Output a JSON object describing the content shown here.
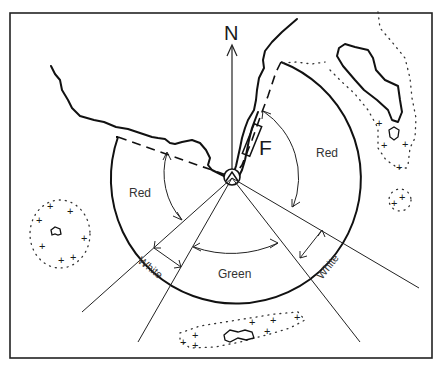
{
  "diagram": {
    "north_label": "N",
    "light_label": "F",
    "sectors": [
      {
        "id": "red-west",
        "label": "Red",
        "color": "#d22"
      },
      {
        "id": "white-west",
        "label": "White",
        "color": "#fff"
      },
      {
        "id": "green",
        "label": "Green",
        "color": "#2a2"
      },
      {
        "id": "white-east",
        "label": "White",
        "color": "#fff"
      },
      {
        "id": "red-east",
        "label": "Red",
        "color": "#d22"
      }
    ],
    "features": {
      "islands": [
        "north-east-island",
        "east-rock",
        "south-west-reef",
        "south-reef"
      ],
      "hazard_symbol": "+"
    },
    "colors": {
      "line": "#111111",
      "background": "#ffffff"
    }
  }
}
